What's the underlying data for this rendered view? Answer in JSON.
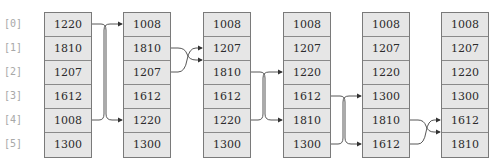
{
  "diagram": {
    "type": "bubble-sort-swap-sequence",
    "indices": [
      "[0]",
      "[1]",
      "[2]",
      "[3]",
      "[4]",
      "[5]"
    ],
    "columns": [
      {
        "values": [
          "1220",
          "1810",
          "1207",
          "1612",
          "1008",
          "1300"
        ]
      },
      {
        "values": [
          "1008",
          "1810",
          "1207",
          "1612",
          "1220",
          "1300"
        ]
      },
      {
        "values": [
          "1008",
          "1207",
          "1810",
          "1612",
          "1220",
          "1300"
        ]
      },
      {
        "values": [
          "1008",
          "1207",
          "1220",
          "1612",
          "1810",
          "1300"
        ]
      },
      {
        "values": [
          "1008",
          "1207",
          "1220",
          "1300",
          "1810",
          "1612"
        ]
      },
      {
        "values": [
          "1008",
          "1207",
          "1220",
          "1300",
          "1612",
          "1810"
        ]
      }
    ],
    "swaps": [
      {
        "from_col": 0,
        "to_col": 1,
        "rows": [
          0,
          4
        ]
      },
      {
        "from_col": 1,
        "to_col": 2,
        "rows": [
          1,
          2
        ]
      },
      {
        "from_col": 2,
        "to_col": 3,
        "rows": [
          2,
          4
        ]
      },
      {
        "from_col": 3,
        "to_col": 4,
        "rows": [
          3,
          5
        ]
      },
      {
        "from_col": 4,
        "to_col": 5,
        "rows": [
          4,
          5
        ]
      }
    ],
    "colors": {
      "cell_fill": "#e6e6e6",
      "cell_border": "#7a7a7a",
      "index_text": "#a8a8a8",
      "arrow": "#333333"
    }
  }
}
